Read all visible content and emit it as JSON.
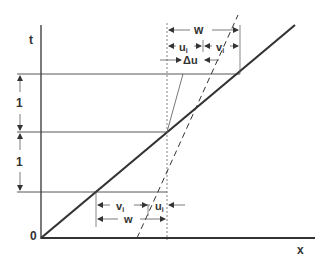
{
  "diagram": {
    "axes": {
      "y_label": "t",
      "x_label": "x",
      "origin_label": "0"
    },
    "interval_labels": [
      "1",
      "1"
    ],
    "top_dimensions": {
      "total": "w",
      "left_part": "u",
      "left_part_sub": "i",
      "right_part": "v",
      "right_part_sub": "i",
      "delta": "Δu"
    },
    "bottom_dimensions": {
      "total": "w",
      "left_part": "v",
      "left_part_sub": "i",
      "right_part": "u",
      "right_part_sub": "i"
    },
    "colors": {
      "line": "#333333",
      "thin_line": "#555555",
      "background": "#ffffff"
    }
  }
}
